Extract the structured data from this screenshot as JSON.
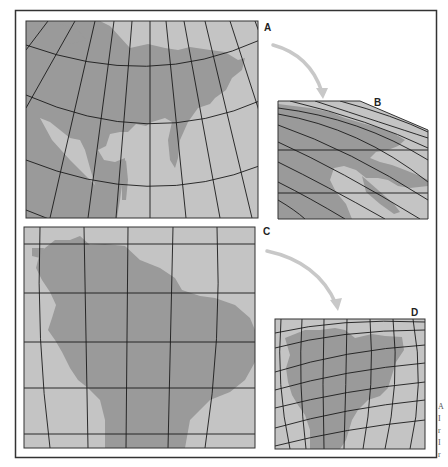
{
  "figure": {
    "colors": {
      "background": "#ffffff",
      "frame": "#333333",
      "ocean": "#c4c4c4",
      "land": "#9a9a9a",
      "graticule": "#1a1a1a",
      "arrow": "#c8c8c8"
    },
    "panels": [
      {
        "id": "A",
        "label": "A",
        "subject": "Northern Asia / Siberia on conic graticule"
      },
      {
        "id": "B",
        "label": "B",
        "subject": "Same region distorted into oblique trapezoid"
      },
      {
        "id": "C",
        "label": "C",
        "subject": "South America on near-rectangular graticule"
      },
      {
        "id": "D",
        "label": "D",
        "subject": "South America on curved graticule"
      }
    ],
    "arrows": [
      {
        "from": "A",
        "to": "B"
      },
      {
        "from": "C",
        "to": "D"
      }
    ],
    "side_text_fragments": [
      "A",
      "I",
      "r",
      "I",
      "r"
    ]
  }
}
